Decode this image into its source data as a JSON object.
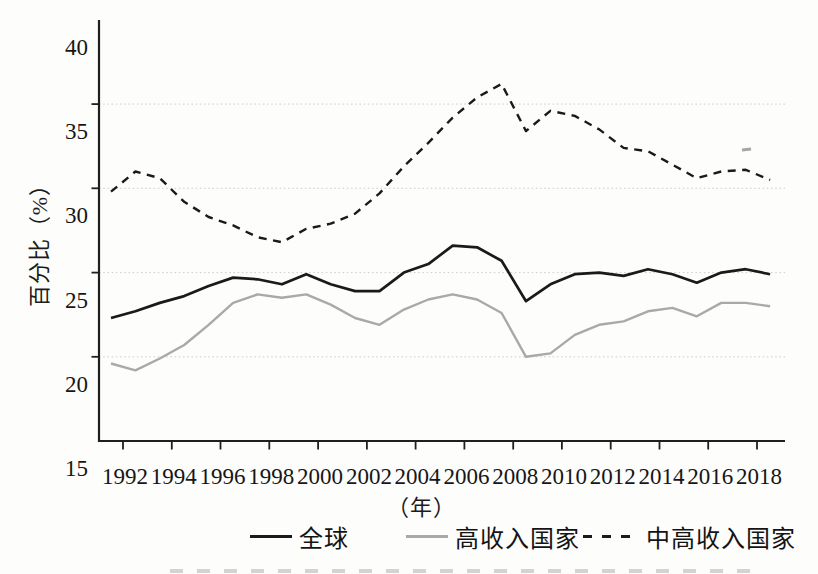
{
  "chart_data": {
    "type": "line",
    "title": "",
    "xlabel": "（年）",
    "ylabel": "百分比（%）",
    "xlim": [
      1991,
      2019.3
    ],
    "ylim": [
      15,
      40
    ],
    "grid": "horizontal dotted gridlines",
    "grid_values": [
      20,
      25,
      30,
      35
    ],
    "y_ticks": [
      15,
      20,
      25,
      30,
      35,
      40
    ],
    "x_tick_years": [
      1992,
      1994,
      1996,
      1998,
      2000,
      2002,
      2004,
      2006,
      2008,
      2010,
      2012,
      2014,
      2016,
      2018
    ],
    "legend_position": "bottom",
    "x": [
      1992,
      1993,
      1994,
      1995,
      1996,
      1997,
      1998,
      1999,
      2000,
      2001,
      2002,
      2003,
      2004,
      2005,
      2006,
      2007,
      2008,
      2009,
      2010,
      2011,
      2012,
      2013,
      2014,
      2015,
      2016,
      2017,
      2018,
      2019
    ],
    "series": [
      {
        "name": "全球",
        "style": "solid",
        "color": "#1a1a1a",
        "width": 2.7,
        "values": [
          22.3,
          22.7,
          23.2,
          23.6,
          24.2,
          24.7,
          24.6,
          24.3,
          24.9,
          24.3,
          23.9,
          23.9,
          25.0,
          25.5,
          26.6,
          26.5,
          25.7,
          23.3,
          24.3,
          24.9,
          25.0,
          24.8,
          25.2,
          24.9,
          24.4,
          25.0,
          25.2,
          24.9
        ]
      },
      {
        "name": "高收入国家",
        "style": "solid",
        "color": "#a9a9a9",
        "width": 2.4,
        "values": [
          19.6,
          19.2,
          19.9,
          20.7,
          21.9,
          23.2,
          23.7,
          23.5,
          23.7,
          23.1,
          22.3,
          21.9,
          22.8,
          23.4,
          23.7,
          23.4,
          22.6,
          20.0,
          20.2,
          21.3,
          21.9,
          22.1,
          22.7,
          22.9,
          22.4,
          23.2,
          23.2,
          23.0
        ]
      },
      {
        "name": "中高收入国家",
        "style": "dashed",
        "color": "#1a1a1a",
        "width": 2.4,
        "values": [
          29.8,
          31.0,
          30.6,
          29.2,
          28.3,
          27.8,
          27.1,
          26.8,
          27.6,
          27.9,
          28.5,
          29.7,
          31.3,
          32.7,
          34.2,
          35.4,
          36.2,
          33.4,
          34.6,
          34.3,
          33.5,
          32.4,
          32.2,
          31.4,
          30.6,
          31.0,
          31.1,
          30.5
        ]
      }
    ],
    "axis_color": "#1f1f1f",
    "gridline_color": "#c6c6c6"
  }
}
